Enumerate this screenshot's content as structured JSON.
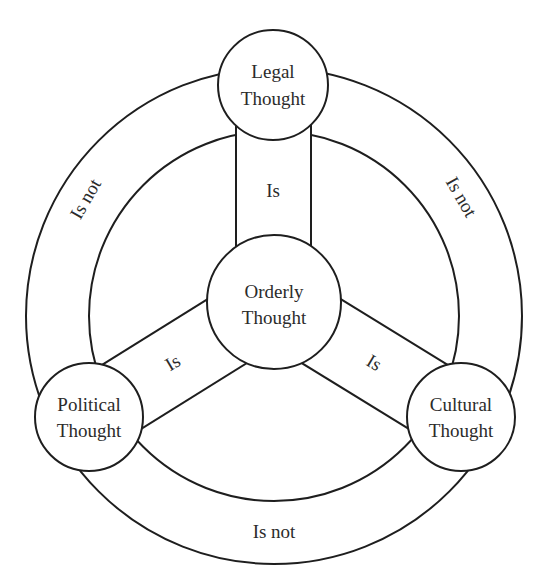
{
  "diagram": {
    "nodes": {
      "legal": {
        "line1": "Legal",
        "line2": "Thought"
      },
      "orderly": {
        "line1": "Orderly",
        "line2": "Thought"
      },
      "political": {
        "line1": "Political",
        "line2": "Thought"
      },
      "cultural": {
        "line1": "Cultural",
        "line2": "Thought"
      }
    },
    "spoke_labels": {
      "legal_orderly": "Is",
      "political_orderly": "Is",
      "cultural_orderly": "Is"
    },
    "ring_labels": {
      "legal_political": "Is not",
      "legal_cultural": "Is not",
      "political_cultural": "Is not"
    },
    "colors": {
      "stroke": "#1e1e1e",
      "text": "#2b2b2b",
      "background": "#ffffff"
    }
  }
}
